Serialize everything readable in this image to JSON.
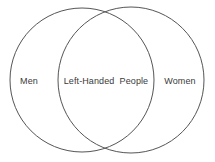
{
  "diagram": {
    "type": "venn-2-set",
    "canvas": {
      "width": 215,
      "height": 162,
      "background": "#ffffff"
    },
    "stroke_color": "#555555",
    "text_color": "#3a3a3a",
    "sets": [
      {
        "id": "men",
        "label": "Men",
        "region": "left-only",
        "center_x": 82,
        "center_y": 80,
        "radius": 72
      },
      {
        "id": "women",
        "label": "Women",
        "region": "right-only",
        "center_x": 131,
        "center_y": 80,
        "radius": 73
      }
    ],
    "intersection": {
      "id": "left-handed-people",
      "label": "Left-Handed  People",
      "region": "overlap",
      "center_x": 106,
      "center_y": 80
    }
  }
}
